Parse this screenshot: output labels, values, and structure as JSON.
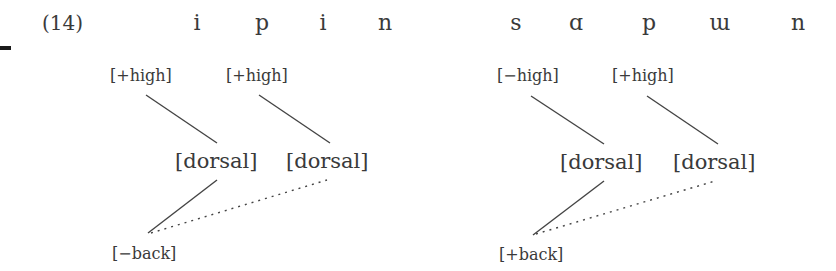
{
  "example": {
    "number": "(14)"
  },
  "left_form": {
    "segments": [
      "i",
      "p",
      "i",
      "n"
    ],
    "features_top": [
      "[+high]",
      "[+high]"
    ],
    "nodes": [
      "[dorsal]",
      "[dorsal]"
    ],
    "feature_bottom": "[−back]"
  },
  "right_form": {
    "segments": [
      "s",
      "ɑ",
      "p",
      "ɯ",
      "n"
    ],
    "features_top": [
      "[−high]",
      "[+high]"
    ],
    "nodes": [
      "[dorsal]",
      "[dorsal]"
    ],
    "feature_bottom": "[+back]"
  },
  "colors": {
    "text": "#3a3a3a",
    "line": "#444444"
  }
}
